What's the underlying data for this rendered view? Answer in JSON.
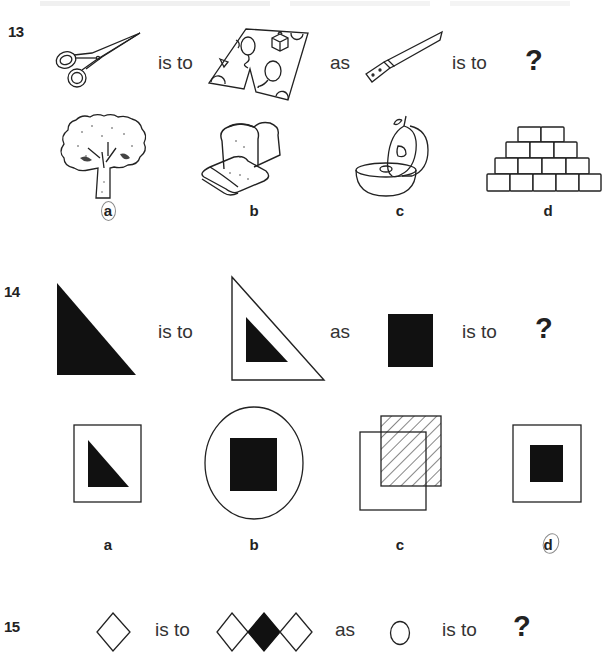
{
  "questions": [
    {
      "number": "13",
      "analogy": {
        "first": {
          "icon": "scissors-icon"
        },
        "relation_1": "is to",
        "second": {
          "icon": "patterned-shorts-icon"
        },
        "connector": "as",
        "third": {
          "icon": "knife-icon"
        },
        "relation_2": "is to",
        "unknown": "?"
      },
      "options": [
        {
          "label": "a",
          "icon": "tree-icon",
          "circled": true
        },
        {
          "label": "b",
          "icon": "bread-loaf-icon",
          "circled": false
        },
        {
          "label": "c",
          "icon": "cut-apple-icon",
          "circled": false
        },
        {
          "label": "d",
          "icon": "brick-pyramid-icon",
          "circled": false
        }
      ]
    },
    {
      "number": "14",
      "analogy": {
        "first": {
          "icon": "black-right-triangle-icon"
        },
        "relation_1": "is to",
        "second": {
          "icon": "triangle-inside-outline-triangle-icon"
        },
        "connector": "as",
        "third": {
          "icon": "black-square-icon"
        },
        "relation_2": "is to",
        "unknown": "?"
      },
      "options": [
        {
          "label": "a",
          "icon": "triangle-in-square-icon",
          "circled": false
        },
        {
          "label": "b",
          "icon": "square-in-circle-icon",
          "circled": false
        },
        {
          "label": "c",
          "icon": "overlapping-squares-hatched-icon",
          "circled": false
        },
        {
          "label": "d",
          "icon": "black-square-in-square-icon",
          "circled": true
        }
      ]
    },
    {
      "number": "15",
      "analogy": {
        "first": {
          "icon": "diamond-outline-icon"
        },
        "relation_1": "is to",
        "second": {
          "icon": "three-diamonds-middle-black-icon"
        },
        "connector": "as",
        "third": {
          "icon": "circle-outline-icon"
        },
        "relation_2": "is to",
        "unknown": "?"
      }
    }
  ],
  "colors": {
    "ink": "#1e1e1e",
    "pencil": "#8a8a8a",
    "background": "#ffffff"
  }
}
